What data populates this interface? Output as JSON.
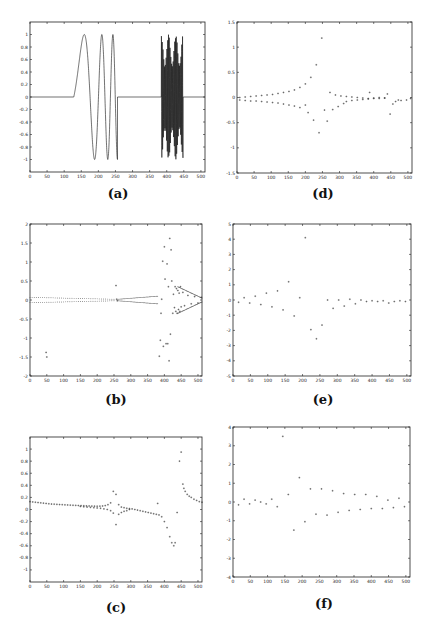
{
  "chart_data": [
    {
      "id": "a",
      "caption": "(a)",
      "type": "line",
      "frame": {
        "x": 30,
        "y": 22,
        "w": 175,
        "h": 150
      },
      "xlim": [
        0,
        512
      ],
      "ylim": [
        -1.2,
        1.2
      ],
      "xticks": [
        0,
        50,
        100,
        150,
        200,
        250,
        300,
        350,
        400,
        450,
        500
      ],
      "yticks": [
        -1,
        -0.8,
        -0.6,
        -0.4,
        -0.2,
        0,
        0.2,
        0.4,
        0.6,
        0.8,
        1
      ],
      "xlabel": "",
      "ylabel": "",
      "title": "",
      "description": "Test signal: zero baseline, a chirp (sinusoid of increasing frequency) from ~128 to ~256 with amplitude 1, zero from 256 to ~384, then a high-frequency burst from ~384 to ~448 with amplitude ~1, then zero to 512.",
      "segments": [
        {
          "kind": "zero",
          "x0": 0,
          "x1": 128
        },
        {
          "kind": "chirp",
          "x0": 128,
          "x1": 256,
          "amplitude": 1
        },
        {
          "kind": "zero",
          "x0": 256,
          "x1": 384
        },
        {
          "kind": "burst",
          "x0": 384,
          "x1": 448,
          "amplitude": 1
        },
        {
          "kind": "zero",
          "x0": 448,
          "x1": 512
        }
      ]
    },
    {
      "id": "b",
      "caption": "(b)",
      "type": "scatter",
      "frame": {
        "x": 30,
        "y": 224,
        "w": 172,
        "h": 152
      },
      "xlim": [
        0,
        512
      ],
      "ylim": [
        -2,
        2
      ],
      "xticks": [
        0,
        50,
        100,
        150,
        200,
        250,
        300,
        350,
        400,
        450,
        500
      ],
      "yticks": [
        -2,
        -1.5,
        -1,
        -0.5,
        0,
        0.5,
        1,
        1.5,
        2
      ],
      "xlabel": "",
      "ylabel": "",
      "title": "",
      "points": [
        [
          48,
          -1.38
        ],
        [
          50,
          -1.5
        ],
        [
          256,
          0.38
        ],
        [
          258,
          0.02
        ],
        [
          260,
          -0.02
        ],
        [
          385,
          -1.48
        ],
        [
          388,
          -1.06
        ],
        [
          390,
          -0.35
        ],
        [
          392,
          0.02
        ],
        [
          395,
          1.02
        ],
        [
          397,
          -1.22
        ],
        [
          400,
          1.4
        ],
        [
          402,
          0.55
        ],
        [
          405,
          -1.15
        ],
        [
          408,
          0.95
        ],
        [
          410,
          -1.15
        ],
        [
          412,
          0.35
        ],
        [
          414,
          -1.6
        ],
        [
          416,
          1.62
        ],
        [
          418,
          -0.9
        ],
        [
          420,
          1.32
        ],
        [
          422,
          0.5
        ],
        [
          425,
          -0.35
        ],
        [
          427,
          0.15
        ],
        [
          430,
          -0.2
        ],
        [
          432,
          0.35
        ],
        [
          434,
          -0.3
        ],
        [
          436,
          0.3
        ],
        [
          438,
          -0.35
        ],
        [
          440,
          0.25
        ],
        [
          442,
          -0.25
        ],
        [
          444,
          0.18
        ],
        [
          446,
          -0.3
        ],
        [
          448,
          0.35
        ],
        [
          450,
          -0.18
        ],
        [
          455,
          0.2
        ],
        [
          460,
          -0.15
        ],
        [
          470,
          0.12
        ],
        [
          480,
          -0.1
        ],
        [
          490,
          0.09
        ],
        [
          500,
          -0.08
        ],
        [
          510,
          0.07
        ]
      ],
      "bands": [
        {
          "x0": 0,
          "x1": 250,
          "upper": [
            0.07,
            0.02
          ],
          "lower": [
            -0.07,
            -0.02
          ]
        },
        {
          "x0": 262,
          "x1": 380,
          "upper": [
            0.02,
            0.1
          ],
          "lower": [
            -0.02,
            -0.1
          ]
        },
        {
          "x0": 440,
          "x1": 512,
          "upper": [
            0.35,
            0.05
          ],
          "lower": [
            -0.35,
            -0.05
          ]
        }
      ]
    },
    {
      "id": "c",
      "caption": "(c)",
      "type": "scatter",
      "frame": {
        "x": 30,
        "y": 437,
        "w": 172,
        "h": 145
      },
      "xlim": [
        0,
        512
      ],
      "ylim": [
        -1.2,
        1.2
      ],
      "xticks": [
        0,
        50,
        100,
        150,
        200,
        250,
        300,
        350,
        400,
        450,
        500
      ],
      "yticks": [
        -1,
        -0.8,
        -0.6,
        -0.4,
        -0.2,
        0,
        0.2,
        0.4,
        0.6,
        0.8,
        1
      ],
      "xlabel": "",
      "ylabel": "",
      "title": "",
      "points": [
        [
          0,
          0.13
        ],
        [
          8,
          0.125
        ],
        [
          16,
          0.12
        ],
        [
          24,
          0.115
        ],
        [
          32,
          0.11
        ],
        [
          40,
          0.105
        ],
        [
          48,
          0.1
        ],
        [
          56,
          0.095
        ],
        [
          64,
          0.09
        ],
        [
          72,
          0.088
        ],
        [
          80,
          0.085
        ],
        [
          88,
          0.082
        ],
        [
          96,
          0.08
        ],
        [
          104,
          0.077
        ],
        [
          112,
          0.075
        ],
        [
          120,
          0.072
        ],
        [
          128,
          0.07
        ],
        [
          136,
          0.068
        ],
        [
          144,
          0.066
        ],
        [
          152,
          0.064
        ],
        [
          160,
          0.062
        ],
        [
          168,
          0.06
        ],
        [
          176,
          0.058
        ],
        [
          184,
          0.056
        ],
        [
          192,
          0.055
        ],
        [
          200,
          0.054
        ],
        [
          208,
          0.055
        ],
        [
          216,
          0.058
        ],
        [
          224,
          0.065
        ],
        [
          232,
          0.08
        ],
        [
          240,
          0.11
        ],
        [
          248,
          0.3
        ],
        [
          256,
          0.25
        ],
        [
          150,
          0.05
        ],
        [
          160,
          0.045
        ],
        [
          170,
          0.04
        ],
        [
          180,
          0.035
        ],
        [
          190,
          0.03
        ],
        [
          200,
          0.025
        ],
        [
          210,
          0.02
        ],
        [
          220,
          0.01
        ],
        [
          230,
          0.0
        ],
        [
          240,
          -0.02
        ],
        [
          248,
          -0.06
        ],
        [
          256,
          -0.25
        ],
        [
          264,
          0.08
        ],
        [
          272,
          0.04
        ],
        [
          280,
          0.03
        ],
        [
          288,
          0.02
        ],
        [
          296,
          0.015
        ],
        [
          304,
          0.01
        ],
        [
          312,
          0.0
        ],
        [
          320,
          -0.01
        ],
        [
          328,
          -0.02
        ],
        [
          336,
          -0.03
        ],
        [
          344,
          -0.04
        ],
        [
          352,
          -0.05
        ],
        [
          360,
          -0.06
        ],
        [
          368,
          -0.07
        ],
        [
          376,
          -0.08
        ],
        [
          264,
          -0.08
        ],
        [
          272,
          -0.05
        ],
        [
          280,
          -0.03
        ],
        [
          288,
          -0.02
        ],
        [
          296,
          0.0
        ],
        [
          380,
          0.1
        ],
        [
          384,
          -0.09
        ],
        [
          392,
          -0.12
        ],
        [
          400,
          -0.2
        ],
        [
          408,
          -0.3
        ],
        [
          416,
          -0.45
        ],
        [
          422,
          -0.55
        ],
        [
          428,
          -0.6
        ],
        [
          432,
          -0.55
        ],
        [
          438,
          -0.05
        ],
        [
          445,
          0.8
        ],
        [
          450,
          0.95
        ],
        [
          455,
          0.42
        ],
        [
          458,
          0.35
        ],
        [
          462,
          0.3
        ],
        [
          468,
          0.25
        ],
        [
          474,
          0.22
        ],
        [
          480,
          0.2
        ],
        [
          488,
          0.17
        ],
        [
          496,
          0.15
        ],
        [
          504,
          0.13
        ],
        [
          512,
          0.12
        ]
      ]
    },
    {
      "id": "d",
      "caption": "(d)",
      "type": "scatter",
      "frame": {
        "x": 237,
        "y": 22,
        "w": 175,
        "h": 151
      },
      "xlim": [
        0,
        512
      ],
      "ylim": [
        -1.5,
        1.5
      ],
      "xticks": [
        0,
        50,
        100,
        150,
        200,
        250,
        300,
        350,
        400,
        450,
        500
      ],
      "yticks": [
        -1.5,
        -1,
        -0.5,
        0,
        0.5,
        1,
        1.5
      ],
      "xlabel": "",
      "ylabel": "",
      "title": "",
      "points": [
        [
          8,
          0.0
        ],
        [
          24,
          0.01
        ],
        [
          40,
          0.02
        ],
        [
          56,
          0.03
        ],
        [
          72,
          0.04
        ],
        [
          88,
          0.05
        ],
        [
          104,
          0.06
        ],
        [
          120,
          0.08
        ],
        [
          136,
          0.1
        ],
        [
          152,
          0.12
        ],
        [
          168,
          0.15
        ],
        [
          184,
          0.2
        ],
        [
          200,
          0.27
        ],
        [
          216,
          0.4
        ],
        [
          232,
          0.65
        ],
        [
          248,
          1.18
        ],
        [
          8,
          -0.05
        ],
        [
          24,
          -0.06
        ],
        [
          40,
          -0.07
        ],
        [
          56,
          -0.07
        ],
        [
          72,
          -0.08
        ],
        [
          88,
          -0.09
        ],
        [
          104,
          -0.1
        ],
        [
          120,
          -0.11
        ],
        [
          136,
          -0.13
        ],
        [
          152,
          -0.15
        ],
        [
          168,
          -0.17
        ],
        [
          184,
          -0.2
        ],
        [
          200,
          -0.15
        ],
        [
          208,
          -0.3
        ],
        [
          224,
          -0.45
        ],
        [
          240,
          -0.7
        ],
        [
          256,
          -0.25
        ],
        [
          264,
          -0.47
        ],
        [
          272,
          0.1
        ],
        [
          280,
          -0.24
        ],
        [
          288,
          0.05
        ],
        [
          296,
          -0.18
        ],
        [
          304,
          0.03
        ],
        [
          312,
          -0.12
        ],
        [
          320,
          0.02
        ],
        [
          336,
          0.01
        ],
        [
          352,
          0.0
        ],
        [
          368,
          -0.01
        ],
        [
          384,
          -0.02
        ],
        [
          388,
          0.1
        ],
        [
          400,
          -0.01
        ],
        [
          416,
          0.0
        ],
        [
          432,
          -0.01
        ],
        [
          440,
          0.07
        ],
        [
          448,
          -0.33
        ],
        [
          456,
          -0.13
        ],
        [
          464,
          -0.08
        ],
        [
          472,
          -0.05
        ],
        [
          480,
          -0.06
        ],
        [
          496,
          -0.05
        ],
        [
          508,
          -0.02
        ],
        [
          320,
          -0.08
        ],
        [
          336,
          -0.06
        ],
        [
          352,
          -0.05
        ],
        [
          368,
          -0.04
        ],
        [
          384,
          -0.03
        ],
        [
          400,
          -0.02
        ],
        [
          416,
          -0.02
        ],
        [
          432,
          -0.01
        ]
      ]
    },
    {
      "id": "e",
      "caption": "(e)",
      "type": "scatter",
      "frame": {
        "x": 233,
        "y": 224,
        "w": 178,
        "h": 152
      },
      "xlim": [
        0,
        512
      ],
      "ylim": [
        -5,
        5
      ],
      "xticks": [
        0,
        50,
        100,
        150,
        200,
        250,
        300,
        350,
        400,
        450,
        500
      ],
      "yticks": [
        -5,
        -4,
        -3,
        -2,
        -1,
        0,
        1,
        2,
        3,
        4,
        5
      ],
      "xlabel": "",
      "ylabel": "",
      "title": "",
      "points": [
        [
          16,
          -0.15
        ],
        [
          32,
          0.15
        ],
        [
          48,
          -0.2
        ],
        [
          64,
          0.25
        ],
        [
          80,
          -0.3
        ],
        [
          96,
          0.45
        ],
        [
          112,
          -0.45
        ],
        [
          128,
          0.6
        ],
        [
          144,
          -0.65
        ],
        [
          160,
          1.2
        ],
        [
          176,
          -1.05
        ],
        [
          192,
          0.15
        ],
        [
          208,
          4.1
        ],
        [
          224,
          -1.95
        ],
        [
          240,
          -2.55
        ],
        [
          256,
          -1.65
        ],
        [
          272,
          0.0
        ],
        [
          288,
          -0.55
        ],
        [
          304,
          0.0
        ],
        [
          320,
          -0.4
        ],
        [
          336,
          0.05
        ],
        [
          352,
          -0.25
        ],
        [
          368,
          0.0
        ],
        [
          384,
          -0.1
        ],
        [
          400,
          -0.05
        ],
        [
          416,
          -0.1
        ],
        [
          432,
          -0.05
        ],
        [
          448,
          -0.2
        ],
        [
          464,
          -0.1
        ],
        [
          480,
          -0.05
        ],
        [
          496,
          -0.1
        ]
      ]
    },
    {
      "id": "f",
      "caption": "(f)",
      "type": "scatter",
      "frame": {
        "x": 233,
        "y": 427,
        "w": 177,
        "h": 150
      },
      "xlim": [
        0,
        512
      ],
      "ylim": [
        -4,
        4
      ],
      "xticks": [
        0,
        50,
        100,
        150,
        200,
        250,
        300,
        350,
        400,
        450,
        500
      ],
      "yticks": [
        -4,
        -3,
        -2,
        -1,
        0,
        1,
        2,
        3,
        4
      ],
      "xlabel": "",
      "ylabel": "",
      "title": "",
      "points": [
        [
          16,
          -0.15
        ],
        [
          32,
          0.15
        ],
        [
          48,
          -0.1
        ],
        [
          64,
          0.1
        ],
        [
          80,
          0.0
        ],
        [
          96,
          -0.1
        ],
        [
          112,
          0.15
        ],
        [
          128,
          -0.25
        ],
        [
          144,
          3.5
        ],
        [
          160,
          0.4
        ],
        [
          176,
          -1.5
        ],
        [
          192,
          1.3
        ],
        [
          208,
          -1.05
        ],
        [
          224,
          0.7
        ],
        [
          240,
          -0.65
        ],
        [
          256,
          0.7
        ],
        [
          272,
          -0.7
        ],
        [
          288,
          0.6
        ],
        [
          304,
          -0.55
        ],
        [
          320,
          0.45
        ],
        [
          336,
          -0.45
        ],
        [
          352,
          0.4
        ],
        [
          368,
          -0.4
        ],
        [
          384,
          0.4
        ],
        [
          400,
          -0.35
        ],
        [
          416,
          0.3
        ],
        [
          432,
          -0.35
        ],
        [
          448,
          0.1
        ],
        [
          464,
          -0.3
        ],
        [
          480,
          0.2
        ],
        [
          496,
          -0.25
        ]
      ]
    }
  ]
}
